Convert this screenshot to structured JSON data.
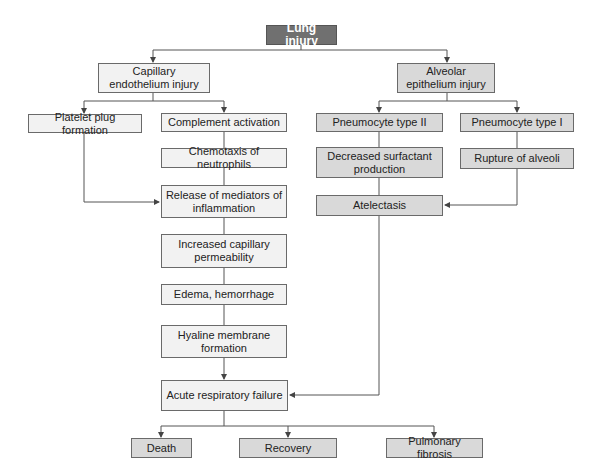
{
  "root": {
    "label": "Lung injury"
  },
  "left_branch": {
    "head": "Capillary endothelium injury",
    "platelet": "Platelet plug formation",
    "chain": [
      "Complement activation",
      "Chemotaxis of neutrophils",
      "Release of mediators of inflammation",
      "Increased capillary permeability",
      "Edema, hemorrhage",
      "Hyaline membrane formation",
      "Acute respiratory failure"
    ]
  },
  "right_branch": {
    "head": "Alveolar epithelium injury",
    "type2": [
      "Pneumocyte type II",
      "Decreased surfactant production",
      "Atelectasis"
    ],
    "type1": [
      "Pneumocyte type I",
      "Rupture of alveoli"
    ]
  },
  "outcomes": [
    "Death",
    "Recovery",
    "Pulmonary fibrosis"
  ],
  "colors": {
    "root": "#707070",
    "light_box": "#f2f2f2",
    "mid_box": "#d9d9d9",
    "line": "#555555"
  }
}
